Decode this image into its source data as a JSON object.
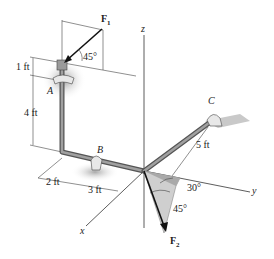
{
  "diagram": {
    "axes": {
      "x": "x",
      "y": "y",
      "z": "z"
    },
    "points": {
      "A": "A",
      "B": "B",
      "C": "C"
    },
    "forces": {
      "F1": {
        "symbol": "F",
        "sub": "1",
        "angle": "45°"
      },
      "F2": {
        "symbol": "F",
        "sub": "2",
        "angle_a": "30°",
        "angle_b": "45°"
      }
    },
    "dimensions": {
      "top": "1 ft",
      "vertical": "4 ft",
      "x_offset": "2 ft",
      "x_mid": "3 ft",
      "y_len": "5 ft"
    },
    "colors": {
      "pipe": "#7a7a7a",
      "shadow": "#bdbdbd",
      "force": "#111111",
      "line": "#333333"
    }
  }
}
